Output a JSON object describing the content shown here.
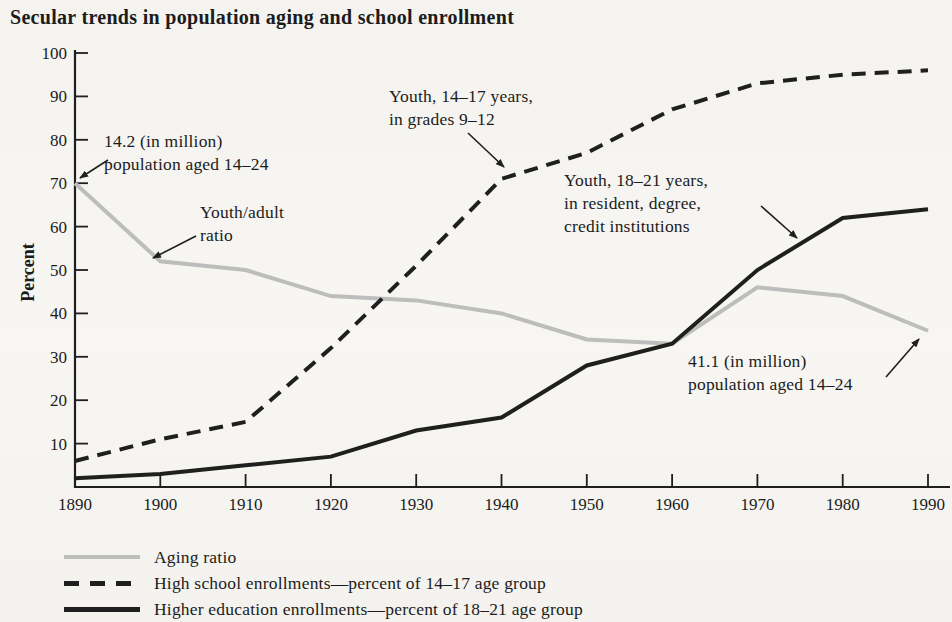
{
  "title": "Secular trends in population aging and school enrollment",
  "colors": {
    "paper": "#f5f4f0",
    "ink": "#1f1f1f",
    "gray_line": "#bdbdbd"
  },
  "chart_data": {
    "type": "line",
    "title": "Secular trends in population aging and school enrollment",
    "xlabel": "",
    "ylabel": "Percent",
    "xlim": [
      1890,
      1990
    ],
    "ylim": [
      0,
      100
    ],
    "grid": false,
    "legend_position": "bottom-left",
    "x": [
      1890,
      1900,
      1910,
      1920,
      1930,
      1940,
      1950,
      1960,
      1970,
      1980,
      1990
    ],
    "y_ticks": [
      10,
      20,
      30,
      40,
      50,
      60,
      70,
      80,
      90,
      100
    ],
    "series": [
      {
        "name": "Aging ratio",
        "style": "solid",
        "color": "#bdbdbd",
        "values": [
          70,
          52,
          50,
          44,
          43,
          40,
          34,
          33,
          46,
          44,
          36
        ]
      },
      {
        "name": "High school enrollments—percent of 14–17 age group",
        "style": "dashed",
        "color": "#1f1f1f",
        "values": [
          6,
          11,
          15,
          32,
          51,
          71,
          77,
          87,
          93,
          95,
          96
        ]
      },
      {
        "name": "Higher education enrollments—percent of 18–21 age group",
        "style": "solid",
        "color": "#1f1f1f",
        "values": [
          2,
          3,
          5,
          7,
          13,
          16,
          28,
          33,
          50,
          62,
          64
        ]
      }
    ],
    "annotations": [
      {
        "id": "population-1890",
        "lines": [
          "14.2 (in million)",
          "population aged 14–24"
        ]
      },
      {
        "id": "youth-adult-ratio",
        "lines": [
          "Youth/adult",
          "ratio"
        ]
      },
      {
        "id": "youth-14-17",
        "lines": [
          "Youth, 14–17 years,",
          "in grades 9–12"
        ]
      },
      {
        "id": "youth-18-21",
        "lines": [
          "Youth, 18–21 years,",
          "in resident, degree,",
          "credit institutions"
        ]
      },
      {
        "id": "population-1990",
        "lines": [
          "41.1 (in million)",
          "population aged 14–24"
        ]
      }
    ]
  }
}
